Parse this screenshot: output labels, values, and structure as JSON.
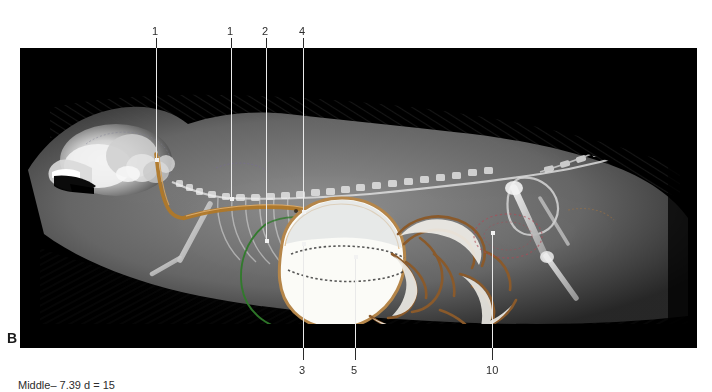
{
  "figure": {
    "panel_letter": "B",
    "caption": "Middle– 7.39 d = 15",
    "modality": "dual-energy contrast radiograph, lateral view, small rodent",
    "plate": {
      "background_color": "#000000",
      "x": 20,
      "y": 48,
      "width": 677,
      "height": 300
    }
  },
  "colors": {
    "plate_background": "#000000",
    "leader_dark": "#2b2b2b",
    "leader_light": "#e9e9e9",
    "label_text": "#2d2d2d",
    "panel_letter": "#1a1a1a",
    "esophagus_outline": "#b07828",
    "stomach_outline": "#b5864a",
    "stomach_fill": "#fbfbf7",
    "liver_outline": "#2f7a2a",
    "intestine_outline": "#8a5a2b",
    "bladder_outline": "#b04a55",
    "bone_bright": "#f4f4f4",
    "soft_tissue": "#6a6a6a"
  },
  "callouts": [
    {
      "id": "c1a",
      "label": "1",
      "label_x": 152,
      "label_y": 26,
      "line_x": 156,
      "line_top": 38,
      "line_bottom": 162,
      "dot_at": "bottom",
      "side": "top",
      "target": "esophagus-cervical"
    },
    {
      "id": "c1b",
      "label": "1",
      "label_x": 227,
      "label_y": 26,
      "line_x": 231,
      "line_top": 38,
      "line_bottom": 201,
      "dot_at": "bottom",
      "side": "top",
      "target": "esophagus-thoracic"
    },
    {
      "id": "c2",
      "label": "2",
      "label_x": 262,
      "label_y": 26,
      "line_x": 266,
      "line_top": 38,
      "line_bottom": 243,
      "dot_at": "bottom",
      "side": "top",
      "target": "liver"
    },
    {
      "id": "c4",
      "label": "4",
      "label_x": 299,
      "label_y": 26,
      "line_x": 303,
      "line_top": 38,
      "line_bottom": 214,
      "dot_at": "bottom",
      "side": "top",
      "target": "gastric-gas-fluid-line"
    },
    {
      "id": "c3",
      "label": "3",
      "label_x": 299,
      "label_y": 365,
      "line_x": 303,
      "line_top": 242,
      "line_bottom": 360,
      "dot_at": "top",
      "side": "bottom",
      "target": "stomach"
    },
    {
      "id": "c5",
      "label": "5",
      "label_x": 351,
      "label_y": 365,
      "line_x": 355,
      "line_top": 255,
      "line_bottom": 360,
      "dot_at": "top",
      "side": "bottom",
      "target": "small-intestine"
    },
    {
      "id": "c10",
      "label": "10",
      "label_x": 486,
      "label_y": 365,
      "line_x": 492,
      "line_top": 231,
      "line_bottom": 360,
      "dot_at": "top",
      "side": "bottom",
      "target": "urinary-bladder"
    }
  ]
}
